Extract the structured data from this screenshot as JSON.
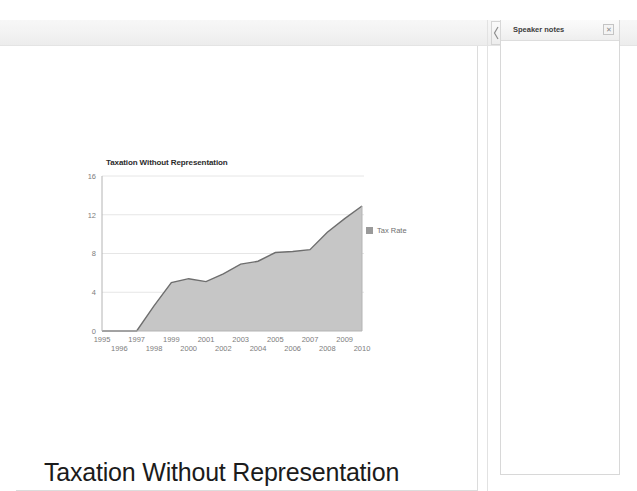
{
  "toolbar": {
    "label": "toolbar"
  },
  "slide": {
    "title": "Taxation Without Representation"
  },
  "notes": {
    "panel_title": "Speaker notes",
    "close_label": "✕",
    "body_text": "",
    "handle_icon": "collapse-arrow-icon"
  },
  "chart_data": {
    "type": "area",
    "title": "Taxation Without Representation",
    "xlabel": "",
    "ylabel": "",
    "ylim": [
      0,
      16
    ],
    "yticks": [
      0,
      4,
      8,
      12,
      16
    ],
    "grid": true,
    "legend_position": "right",
    "legend": [
      "Tax Rate"
    ],
    "series_color": "#c6c6c6",
    "line_color": "#6e6e6e",
    "categories": [
      "1995",
      "1996",
      "1997",
      "1998",
      "1999",
      "2000",
      "2001",
      "2002",
      "2003",
      "2004",
      "2005",
      "2006",
      "2007",
      "2008",
      "2009",
      "2010"
    ],
    "xticks_top": [
      "1995",
      "1997",
      "1999",
      "2001",
      "2003",
      "2005",
      "2007",
      "2009"
    ],
    "xticks_bottom": [
      "1996",
      "1998",
      "2000",
      "2002",
      "2004",
      "2006",
      "2008",
      "2010"
    ],
    "series": [
      {
        "name": "Tax Rate",
        "values": [
          0,
          0,
          0,
          2.6,
          5.0,
          5.4,
          5.1,
          5.9,
          6.9,
          7.2,
          8.1,
          8.2,
          8.4,
          10.2,
          11.6,
          12.9
        ]
      }
    ]
  }
}
